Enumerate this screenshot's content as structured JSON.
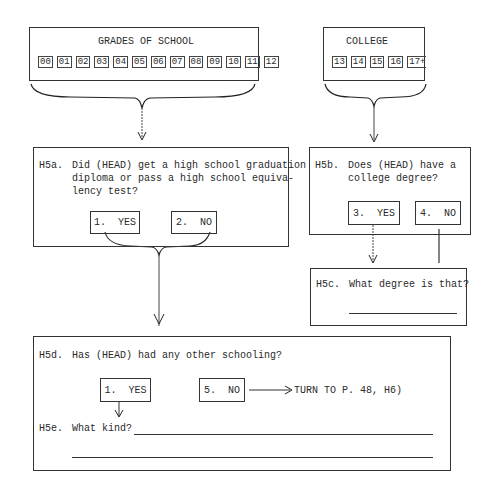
{
  "grades_box": {
    "title": "GRADES OF SCHOOL",
    "codes": [
      "00",
      "01",
      "02",
      "03",
      "04",
      "05",
      "06",
      "07",
      "08",
      "09",
      "10",
      "11",
      "12"
    ]
  },
  "college_box": {
    "title": "COLLEGE",
    "codes": [
      "13",
      "14",
      "15",
      "16",
      "17+"
    ]
  },
  "h5a": {
    "label": "H5a.",
    "question_lines": [
      "Did (HEAD) get a high school graduation",
      "diploma or pass a high school equiva-",
      "lency test?"
    ],
    "options": [
      {
        "text": "1.  YES"
      },
      {
        "text": "2.  NO"
      }
    ]
  },
  "h5b": {
    "label": "H5b.",
    "question_lines": [
      "Does (HEAD) have a",
      "college degree?"
    ],
    "options": [
      {
        "text": "3.  YES"
      },
      {
        "text": "4.  NO"
      }
    ]
  },
  "h5c": {
    "label": "H5c.",
    "question": "What degree is that?"
  },
  "h5d": {
    "label": "H5d.",
    "question": "Has (HEAD) had any other schooling?",
    "options": [
      {
        "text": "1.  YES"
      },
      {
        "text": "5.  NO"
      }
    ],
    "skip_instruction": "TURN TO P. 48, H6)"
  },
  "h5e": {
    "label": "H5e.",
    "question": "What kind?"
  }
}
